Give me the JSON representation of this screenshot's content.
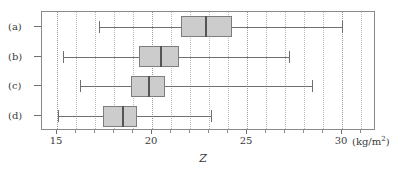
{
  "chart_data": {
    "type": "box",
    "title": "",
    "xlabel": "Z",
    "ylabel": "",
    "unit": "(kg/m",
    "unit_exponent": "2",
    "unit_close": ")",
    "xlim": [
      14.0,
      31.6
    ],
    "xticks": [
      15,
      20,
      25,
      30
    ],
    "xticklabels": [
      "15",
      "20",
      "25",
      "30"
    ],
    "minor_tick_step": 1,
    "grid": true,
    "grid_orientation": "vertical",
    "orientation": "horizontal",
    "legend": "none",
    "categories": [
      "(a)",
      "(b)",
      "(c)",
      "(d)"
    ],
    "boxes": [
      {
        "label": "(a)",
        "min": 17.2,
        "q1": 21.5,
        "median": 22.8,
        "q3": 24.2,
        "max": 30.0
      },
      {
        "label": "(b)",
        "min": 15.3,
        "q1": 19.3,
        "median": 20.4,
        "q3": 21.4,
        "max": 27.2
      },
      {
        "label": "(c)",
        "min": 16.2,
        "q1": 18.9,
        "median": 19.8,
        "q3": 20.7,
        "max": 28.4
      },
      {
        "label": "(d)",
        "min": 15.05,
        "q1": 17.4,
        "median": 18.4,
        "q3": 19.2,
        "max": 23.1
      }
    ],
    "colors": {
      "box_fill": "#cccccc",
      "box_edge": "#7d7d7d",
      "median": "#555555",
      "whisker": "#6f6f6f",
      "grid": "#b9b9b9",
      "frame": "#8a8a8a",
      "text": "#3a3a3a",
      "background": "#ffffff"
    }
  }
}
